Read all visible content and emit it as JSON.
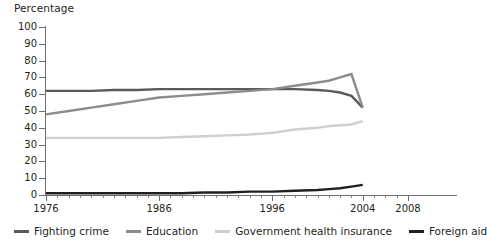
{
  "chart_data": {
    "type": "line",
    "title": "",
    "subtitle": "",
    "xlabel": "",
    "ylabel": "Percentage",
    "xlim": [
      1976,
      2008
    ],
    "ylim": [
      0,
      100
    ],
    "grid": false,
    "legend_position": "bottom",
    "y_ticks": [
      0,
      10,
      20,
      30,
      40,
      50,
      60,
      70,
      80,
      90,
      100
    ],
    "x_ticks_major": [
      1976,
      1986,
      1996,
      2004,
      2008
    ],
    "x_ticks_minor_step": 1,
    "x": [
      1976,
      1978,
      1980,
      1982,
      1984,
      1986,
      1988,
      1990,
      1992,
      1994,
      1996,
      1998,
      2000,
      2001,
      2002,
      2003,
      2004
    ],
    "series": [
      {
        "name": "Fighting crime",
        "color": "#5a5a5a",
        "values": [
          62,
          62,
          62,
          62.5,
          62.5,
          63,
          63,
          63,
          63,
          63,
          63,
          63,
          62.5,
          62,
          61,
          59,
          52
        ]
      },
      {
        "name": "Education",
        "color": "#8c8c8c",
        "values": [
          48,
          50,
          52,
          54,
          56,
          58,
          59,
          60,
          61,
          62,
          63,
          65,
          67,
          68,
          70,
          72,
          52
        ]
      },
      {
        "name": "Government health insurance",
        "color": "#cfcfcf",
        "values": [
          34,
          34,
          34,
          34,
          34,
          34,
          34.5,
          35,
          35.5,
          36,
          37,
          39,
          40,
          41,
          41.5,
          42,
          44
        ]
      },
      {
        "name": "Foreign aid",
        "color": "#231f20",
        "values": [
          1,
          1,
          1,
          1,
          1,
          1,
          1,
          1.5,
          1.5,
          2,
          2,
          2.5,
          3,
          3.5,
          4,
          5,
          6
        ]
      }
    ]
  },
  "legend": {
    "items": [
      {
        "label": "Fighting crime",
        "color": "#5a5a5a"
      },
      {
        "label": "Education",
        "color": "#8c8c8c"
      },
      {
        "label": "Government health insurance",
        "color": "#cfcfcf"
      },
      {
        "label": "Foreign aid",
        "color": "#231f20"
      }
    ]
  },
  "axes": {
    "y_title": "Percentage",
    "y_tick_labels": [
      "100",
      "90",
      "80",
      "70",
      "60",
      "50",
      "40",
      "30",
      "20",
      "10",
      "0"
    ],
    "x_tick_labels": [
      "1976",
      "1986",
      "1996",
      "2004",
      "2008"
    ]
  }
}
